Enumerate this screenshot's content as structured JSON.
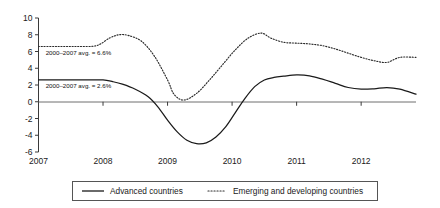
{
  "chart_data": {
    "type": "line",
    "title": "",
    "xlabel": "",
    "ylabel": "",
    "xlim": [
      2007.0,
      2012.85
    ],
    "ylim": [
      -6,
      10
    ],
    "grid": false,
    "legend_position": "bottom",
    "y_ticks": [
      "10",
      "8",
      "6",
      "4",
      "2",
      "0",
      "-2",
      "-4",
      "-6"
    ],
    "y_tick_values": [
      10,
      8,
      6,
      4,
      2,
      0,
      -2,
      -4,
      -6
    ],
    "x_ticks": [
      "2007",
      "2008",
      "2009",
      "2010",
      "2011",
      "2012"
    ],
    "x_tick_values": [
      2007,
      2008,
      2009,
      2010,
      2011,
      2012
    ],
    "annotations": [
      {
        "text": "2000–2007 avg. = 6.6%",
        "x": 2007.08,
        "y": 6.6,
        "series": "Emerging and developing countries"
      },
      {
        "text": "2000–2007 avg. = 2.6%",
        "x": 2007.08,
        "y": 2.6,
        "series": "Advanced countries"
      }
    ],
    "series": [
      {
        "name": "Advanced countries",
        "style": "solid",
        "color": "#1a1a1a",
        "x": [
          2007.0,
          2007.25,
          2007.5,
          2007.75,
          2008.0,
          2008.15,
          2008.3,
          2008.5,
          2008.7,
          2008.85,
          2009.0,
          2009.15,
          2009.3,
          2009.45,
          2009.6,
          2009.75,
          2009.9,
          2010.05,
          2010.2,
          2010.35,
          2010.5,
          2010.65,
          2010.8,
          2011.0,
          2011.2,
          2011.4,
          2011.6,
          2011.8,
          2012.0,
          2012.2,
          2012.4,
          2012.6,
          2012.85
        ],
        "values": [
          2.6,
          2.6,
          2.6,
          2.6,
          2.6,
          2.4,
          2.1,
          1.5,
          0.6,
          -0.6,
          -2.2,
          -3.6,
          -4.6,
          -5.0,
          -4.9,
          -4.2,
          -3.0,
          -1.3,
          0.4,
          1.8,
          2.6,
          2.9,
          3.05,
          3.2,
          3.1,
          2.7,
          2.2,
          1.7,
          1.5,
          1.55,
          1.7,
          1.5,
          0.9
        ]
      },
      {
        "name": "Emerging and developing countries",
        "style": "dotted",
        "color": "#2a2a2a",
        "x": [
          2007.0,
          2007.3,
          2007.6,
          2007.9,
          2008.1,
          2008.25,
          2008.4,
          2008.6,
          2008.8,
          2009.0,
          2009.1,
          2009.25,
          2009.45,
          2009.65,
          2009.85,
          2010.05,
          2010.25,
          2010.45,
          2010.6,
          2010.8,
          2011.0,
          2011.2,
          2011.4,
          2011.6,
          2011.8,
          2012.0,
          2012.2,
          2012.4,
          2012.6,
          2012.85
        ],
        "values": [
          6.6,
          6.6,
          6.6,
          6.7,
          7.6,
          8.0,
          7.9,
          7.2,
          5.4,
          2.6,
          0.9,
          0.2,
          1.0,
          2.6,
          4.4,
          6.2,
          7.6,
          8.2,
          7.6,
          7.1,
          7.0,
          6.9,
          6.7,
          6.3,
          5.8,
          5.3,
          4.9,
          4.7,
          5.3,
          5.3
        ]
      }
    ]
  },
  "legend": {
    "items": [
      {
        "label": "Advanced countries",
        "style": "solid"
      },
      {
        "label": "Emerging and developing countries",
        "style": "dotted"
      }
    ]
  }
}
